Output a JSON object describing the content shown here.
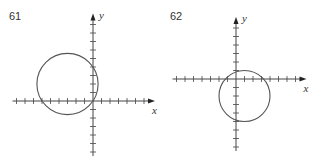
{
  "graphs": [
    {
      "number": "61",
      "x_axis_label": "x",
      "y_axis_label": "y",
      "circle": {
        "center": [
          -3,
          2
        ],
        "radius": 3.6
      },
      "unit_px": 8.5,
      "origin_px": [
        93,
        101
      ]
    },
    {
      "number": "62",
      "x_axis_label": "x",
      "y_axis_label": "y",
      "circle": {
        "center": [
          1,
          -2
        ],
        "radius": 3
      },
      "unit_px": 8.5,
      "origin_px": [
        236,
        79
      ]
    }
  ]
}
